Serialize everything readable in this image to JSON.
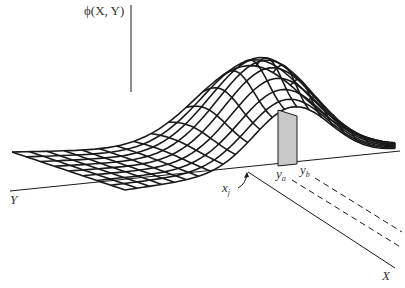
{
  "figure": {
    "type": "3d-surface-wireframe",
    "labels": {
      "z_axis": "ϕ(X, Y)",
      "y_axis": "Y",
      "x_axis": "X",
      "x_j_main": "x",
      "x_j_sub": "j",
      "y_a_main": "y",
      "y_a_sub": "a",
      "y_b_main": "y",
      "y_b_sub": "b"
    },
    "colors": {
      "line": "#1a1a1a",
      "slice_fill": "#c8c8c8",
      "background": "#ffffff"
    }
  }
}
